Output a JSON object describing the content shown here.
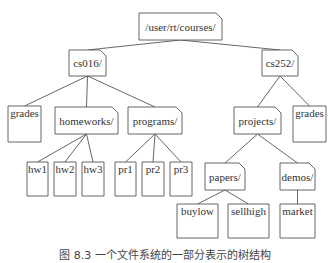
{
  "diagram": {
    "type": "tree",
    "colors": {
      "stroke": "#555555",
      "text": "#333333",
      "background": "#ffffff"
    },
    "nodes": [
      {
        "id": "root",
        "label": "/user/rt/courses/",
        "kind": "directory",
        "x": 139,
        "y": 13,
        "w": 83,
        "h": 27
      },
      {
        "id": "cs016",
        "label": "cs016/",
        "kind": "directory",
        "x": 69,
        "y": 50,
        "w": 37,
        "h": 26
      },
      {
        "id": "cs252",
        "label": "cs252/",
        "kind": "directory",
        "x": 262,
        "y": 50,
        "w": 36,
        "h": 26
      },
      {
        "id": "grades1",
        "label": "grades",
        "kind": "file",
        "x": 8,
        "y": 106,
        "w": 33,
        "h": 36
      },
      {
        "id": "homeworks",
        "label": "homeworks/",
        "kind": "directory",
        "x": 55,
        "y": 107,
        "w": 63,
        "h": 27
      },
      {
        "id": "programs",
        "label": "programs/",
        "kind": "directory",
        "x": 128,
        "y": 107,
        "w": 54,
        "h": 27
      },
      {
        "id": "projects",
        "label": "projects/",
        "kind": "directory",
        "x": 234,
        "y": 107,
        "w": 47,
        "h": 27
      },
      {
        "id": "grades2",
        "label": "grades",
        "kind": "file",
        "x": 293,
        "y": 106,
        "w": 33,
        "h": 36
      },
      {
        "id": "hw1",
        "label": "hw1",
        "kind": "file",
        "x": 27,
        "y": 162,
        "w": 21,
        "h": 34
      },
      {
        "id": "hw2",
        "label": "hw2",
        "kind": "file",
        "x": 54,
        "y": 162,
        "w": 22,
        "h": 34
      },
      {
        "id": "hw3",
        "label": "hw3",
        "kind": "file",
        "x": 82,
        "y": 162,
        "w": 22,
        "h": 34
      },
      {
        "id": "pr1",
        "label": "pr1",
        "kind": "file",
        "x": 115,
        "y": 162,
        "w": 21,
        "h": 34
      },
      {
        "id": "pr2",
        "label": "pr2",
        "kind": "file",
        "x": 142,
        "y": 162,
        "w": 22,
        "h": 34
      },
      {
        "id": "pr3",
        "label": "pr3",
        "kind": "file",
        "x": 170,
        "y": 162,
        "w": 22,
        "h": 34
      },
      {
        "id": "papers",
        "label": "papers/",
        "kind": "directory",
        "x": 205,
        "y": 163,
        "w": 40,
        "h": 27
      },
      {
        "id": "demos",
        "label": "demos/",
        "kind": "directory",
        "x": 280,
        "y": 163,
        "w": 35,
        "h": 27
      },
      {
        "id": "buylow",
        "label": "buylow",
        "kind": "file",
        "x": 177,
        "y": 204,
        "w": 41,
        "h": 34
      },
      {
        "id": "sellhigh",
        "label": "sellhigh",
        "kind": "file",
        "x": 228,
        "y": 204,
        "w": 41,
        "h": 34
      },
      {
        "id": "market",
        "label": "market",
        "kind": "file",
        "x": 280,
        "y": 204,
        "w": 35,
        "h": 34
      }
    ],
    "edges": [
      {
        "from": "root",
        "to": "cs016"
      },
      {
        "from": "root",
        "to": "cs252"
      },
      {
        "from": "cs016",
        "to": "grades1"
      },
      {
        "from": "cs016",
        "to": "homeworks"
      },
      {
        "from": "cs016",
        "to": "programs"
      },
      {
        "from": "cs252",
        "to": "projects"
      },
      {
        "from": "cs252",
        "to": "grades2"
      },
      {
        "from": "homeworks",
        "to": "hw1"
      },
      {
        "from": "homeworks",
        "to": "hw2"
      },
      {
        "from": "homeworks",
        "to": "hw3"
      },
      {
        "from": "programs",
        "to": "pr1"
      },
      {
        "from": "programs",
        "to": "pr2"
      },
      {
        "from": "programs",
        "to": "pr3"
      },
      {
        "from": "projects",
        "to": "papers"
      },
      {
        "from": "projects",
        "to": "demos"
      },
      {
        "from": "papers",
        "to": "buylow"
      },
      {
        "from": "papers",
        "to": "sellhigh"
      },
      {
        "from": "demos",
        "to": "market"
      }
    ]
  },
  "caption": "图 8.3  一个文件系统的一部分表示的树结构"
}
